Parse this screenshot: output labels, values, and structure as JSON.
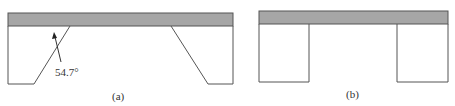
{
  "figure_a": {
    "angle_label": "54.7°",
    "caption": "(a)"
  },
  "figure_b": {
    "caption": "(b)"
  },
  "colors": {
    "mask_fill": "#a6a6a6",
    "outline": "#555555",
    "background": "#ffffff"
  }
}
